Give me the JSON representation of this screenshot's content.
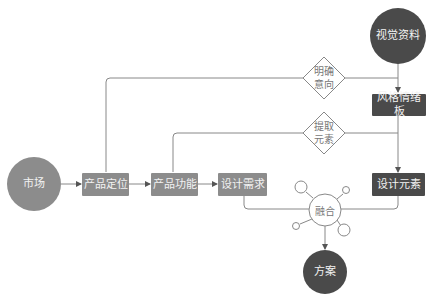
{
  "colors": {
    "light_node": "#8c8c8c",
    "dark_node": "#4a4a4a",
    "line": "#888888",
    "text_light": "#f2f2f2",
    "text_dark": "#777777"
  },
  "nodes": {
    "market": "市场",
    "product_positioning": "产品定位",
    "product_function": "产品功能",
    "design_requirements": "设计需求",
    "visual_materials": "视觉资料",
    "style_moodboard": "风格情绪板",
    "design_elements": "设计元素",
    "fusion": "融合",
    "solution": "方案"
  },
  "decisions": {
    "clarify_intent": {
      "line1": "明确",
      "line2": "意向"
    },
    "extract_elements": {
      "line1": "提取",
      "line2": "元素"
    }
  }
}
